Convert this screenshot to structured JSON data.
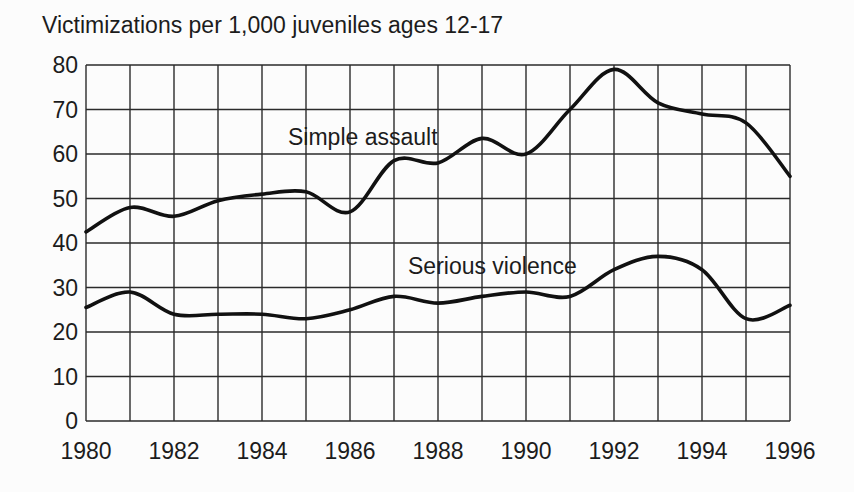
{
  "title": "Victimizations per 1,000 juveniles ages 12-17",
  "colors": {
    "background": "#fcfcfc",
    "ink": "#1c1c1c",
    "grid": "#2b2b2b",
    "line": "#111111"
  },
  "chart_data": {
    "type": "line",
    "title": "Victimizations per 1,000 juveniles ages 12-17",
    "xlabel": "",
    "ylabel": "",
    "x": [
      1980,
      1981,
      1982,
      1983,
      1984,
      1985,
      1986,
      1987,
      1988,
      1989,
      1990,
      1991,
      1992,
      1993,
      1994,
      1995,
      1996
    ],
    "x_tick_labels": [
      "1980",
      "1982",
      "1984",
      "1986",
      "1988",
      "1990",
      "1992",
      "1994",
      "1996"
    ],
    "y_ticks": [
      0,
      10,
      20,
      30,
      40,
      50,
      60,
      70,
      80
    ],
    "y_tick_labels": [
      "0",
      "10",
      "20",
      "30",
      "40",
      "50",
      "60",
      "70",
      "80"
    ],
    "xlim": [
      1980,
      1996
    ],
    "ylim": [
      0,
      80
    ],
    "grid": true,
    "legend_position": "inline-labels",
    "series": [
      {
        "name": "Simple assault",
        "values": [
          42.5,
          48,
          46,
          49.5,
          51,
          51.5,
          47,
          58.5,
          58,
          63.5,
          60,
          70,
          79,
          71.5,
          69,
          67,
          55
        ],
        "label_x_px": 288,
        "label_y_px": 145
      },
      {
        "name": "Serious violence",
        "values": [
          25.5,
          29,
          24,
          24,
          24,
          23,
          25,
          28,
          26.5,
          28,
          29,
          28,
          34,
          37,
          34,
          23,
          26
        ],
        "label_x_px": 408,
        "label_y_px": 274
      }
    ]
  }
}
